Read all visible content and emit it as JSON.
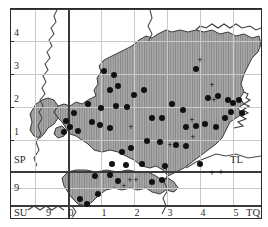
{
  "figure": {
    "type": "distribution-map",
    "background_color": "#ffffff",
    "frame_color": "#2b2b2b",
    "land_fill_color": "#a9a9a9",
    "hatch_color": "#8a8a8a",
    "coastline_color": "#3a3a3a",
    "grid_color": "#c9c9c9",
    "marker_color": "#111111"
  },
  "axes": {
    "x_ticks": [
      {
        "label": "0",
        "x": 71
      },
      {
        "label": "1",
        "x": 104
      },
      {
        "label": "2",
        "x": 137
      },
      {
        "label": "3",
        "x": 170
      },
      {
        "label": "4",
        "x": 203
      },
      {
        "label": "5",
        "x": 236
      }
    ],
    "y_ticks": [
      {
        "label": "4",
        "y": 33
      },
      {
        "label": "3",
        "y": 66
      },
      {
        "label": "2",
        "y": 99
      },
      {
        "label": "1",
        "y": 132
      }
    ],
    "corner_labels": [
      {
        "name": "grid-square-sp",
        "label": "SP",
        "x": 14,
        "y": 155
      },
      {
        "name": "grid-square-tl",
        "label": "TL",
        "x": 230,
        "y": 155
      },
      {
        "name": "grid-square-su",
        "label": "SU",
        "x": 14,
        "y": 208
      },
      {
        "name": "grid-square-tq",
        "label": "TQ",
        "x": 246,
        "y": 208
      },
      {
        "name": "y-tick-9-upper",
        "label": "9",
        "x": 14,
        "y": 183
      },
      {
        "name": "x-tick-9",
        "label": "9",
        "x": 46,
        "y": 208
      }
    ]
  },
  "chart_data": {
    "type": "scatter",
    "title": "",
    "xlabel": "",
    "ylabel": "",
    "grid": true,
    "xlim": [
      -0.3,
      5.8
    ],
    "ylim": [
      -0.6,
      4.7
    ],
    "legend": [],
    "series": [
      {
        "name": "records-filled-circle",
        "marker": "filled-circle",
        "points_px": [
          [
            104,
            71
          ],
          [
            114,
            75
          ],
          [
            88,
            104
          ],
          [
            101,
            108
          ],
          [
            116,
            106
          ],
          [
            127,
            107
          ],
          [
            74,
            113
          ],
          [
            66,
            121
          ],
          [
            70,
            127
          ],
          [
            64,
            132
          ],
          [
            78,
            131
          ],
          [
            92,
            122
          ],
          [
            100,
            125
          ],
          [
            110,
            128
          ],
          [
            152,
            118
          ],
          [
            162,
            118
          ],
          [
            196,
            69
          ],
          [
            208,
            98
          ],
          [
            218,
            96
          ],
          [
            186,
            127
          ],
          [
            196,
            126
          ],
          [
            205,
            124
          ],
          [
            216,
            127
          ],
          [
            228,
            100
          ],
          [
            233,
            103
          ],
          [
            231,
            112
          ],
          [
            225,
            118
          ],
          [
            239,
            100
          ],
          [
            242,
            113
          ],
          [
            160,
            142
          ],
          [
            147,
            141
          ],
          [
            176,
            145
          ],
          [
            186,
            146
          ],
          [
            131,
            148
          ],
          [
            122,
            152
          ],
          [
            112,
            164
          ],
          [
            126,
            165
          ],
          [
            142,
            164
          ],
          [
            95,
            176
          ],
          [
            110,
            175
          ],
          [
            118,
            181
          ],
          [
            98,
            194
          ],
          [
            152,
            182
          ],
          [
            162,
            180
          ],
          [
            80,
            199
          ],
          [
            87,
            204
          ],
          [
            165,
            166
          ],
          [
            200,
            164
          ],
          [
            172,
            104
          ],
          [
            183,
            110
          ],
          [
            144,
            90
          ],
          [
            134,
            95
          ],
          [
            110,
            90
          ],
          [
            118,
            86
          ]
        ]
      },
      {
        "name": "records-plus-sign",
        "marker": "plus",
        "points_px": [
          [
            131,
            127
          ],
          [
            192,
            120
          ],
          [
            193,
            137
          ],
          [
            130,
            180
          ],
          [
            136,
            180
          ],
          [
            124,
            186
          ],
          [
            212,
            173
          ],
          [
            221,
            172
          ],
          [
            214,
            100
          ],
          [
            212,
            85
          ],
          [
            200,
            60
          ],
          [
            170,
            145
          ]
        ]
      }
    ]
  }
}
